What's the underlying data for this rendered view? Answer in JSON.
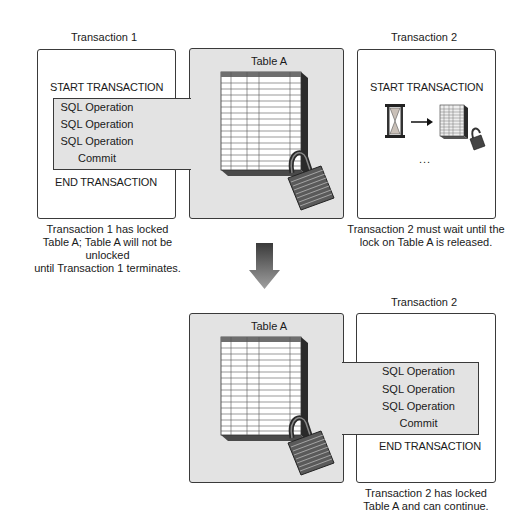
{
  "top": {
    "transaction1": {
      "title": "Transaction 1",
      "start": "START TRANSACTION",
      "operations": [
        "SQL Operation",
        "SQL Operation",
        "SQL Operation",
        "Commit"
      ],
      "end": "END TRANSACTION",
      "caption_lines": [
        "Transaction 1 has locked",
        "Table A; Table A will not be unlocked",
        "until Transaction 1 terminates."
      ]
    },
    "table": {
      "title": "Table A",
      "icon": "locked-table-icon"
    },
    "transaction2": {
      "title": "Transaction 2",
      "start": "START TRANSACTION",
      "wait_icons": [
        "hourglass-icon",
        "arrow-right-icon",
        "table-icon",
        "padlock-icon"
      ],
      "ellipsis": "...",
      "caption_lines": [
        "Transaction 2 must wait until the",
        "lock on Table A is released."
      ]
    }
  },
  "transition": {
    "icon": "down-arrow-icon"
  },
  "bottom": {
    "table": {
      "title": "Table A",
      "icon": "locked-table-icon"
    },
    "transaction2": {
      "title": "Transaction 2",
      "operations": [
        "SQL Operation",
        "SQL Operation",
        "SQL Operation",
        "Commit"
      ],
      "end": "END TRANSACTION",
      "caption_lines": [
        "Transaction 2 has locked",
        "Table A and can continue."
      ]
    }
  },
  "colors": {
    "panel_gray": "#e3e3e3",
    "border": "#3a3a3a",
    "table_header": "#6e6e6e",
    "table_side": "#2a2a2a"
  }
}
